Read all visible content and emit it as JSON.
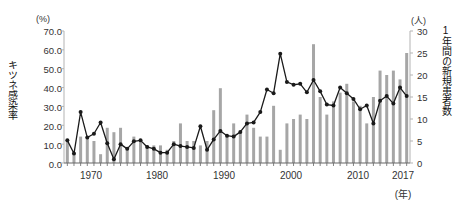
{
  "chart_data": {
    "type": "bar",
    "title": "",
    "subtitle": "",
    "xlabel": "(年)",
    "ylabel_left": "キツネ感染率",
    "ylabel_right": "1年間の新規患者数",
    "yunit_left": "(%)",
    "yunit_right": "(人)",
    "ylim_left": [
      0,
      70
    ],
    "ylim_right": [
      0,
      30
    ],
    "yticks_left": [
      "0.0",
      "10.0",
      "20.0",
      "30.0",
      "40.0",
      "50.0",
      "60.0",
      "70.0"
    ],
    "yticks_right": [
      "0",
      "5",
      "10",
      "15",
      "20",
      "25",
      "30"
    ],
    "xlim": [
      1966,
      2017
    ],
    "xticks": [
      1970,
      1980,
      1990,
      2000,
      2010,
      2017
    ],
    "xtick_labels": [
      "1970",
      "1980",
      "1990",
      "2000",
      "2010",
      "2017"
    ],
    "grid": false,
    "legend": "none",
    "bar_color": "#a6a6a6",
    "line_color": "#1a1a1a",
    "marker_color": "#1a1a1a",
    "axis_color": "#b3b3b3",
    "x": [
      1966,
      1967,
      1968,
      1969,
      1970,
      1971,
      1972,
      1973,
      1974,
      1975,
      1976,
      1977,
      1978,
      1979,
      1980,
      1981,
      1982,
      1983,
      1984,
      1985,
      1986,
      1987,
      1988,
      1989,
      1990,
      1991,
      1992,
      1993,
      1994,
      1995,
      1996,
      1997,
      1998,
      1999,
      2000,
      2001,
      2002,
      2003,
      2004,
      2005,
      2006,
      2007,
      2008,
      2009,
      2010,
      2011,
      2012,
      2013,
      2014,
      2015,
      2016,
      2017
    ],
    "series": [
      {
        "name": "1年間の新規患者数",
        "type": "bar",
        "axis": "right",
        "unit": "人",
        "values": [
          5,
          2,
          6,
          6,
          5,
          2,
          8,
          7,
          8,
          3,
          6,
          5,
          4,
          4,
          4,
          3,
          5,
          9,
          5,
          5,
          4,
          5,
          12,
          17,
          6,
          9,
          7,
          11,
          8,
          6,
          6,
          13,
          3,
          9,
          10,
          11,
          10,
          27,
          15,
          11,
          14,
          16,
          18,
          14,
          13,
          9,
          15,
          21,
          20,
          21,
          19,
          25
        ]
      },
      {
        "name": "キツネ感染率",
        "type": "line",
        "axis": "left",
        "unit": "%",
        "values": [
          12.0,
          5.0,
          27.0,
          13.5,
          15.5,
          21.5,
          10.5,
          2.0,
          10.0,
          7.5,
          11.5,
          12.0,
          8.5,
          7.5,
          5.5,
          5.5,
          10.0,
          9.0,
          8.5,
          8.0,
          19.5,
          7.0,
          12.5,
          17.0,
          14.5,
          14.0,
          16.5,
          21.0,
          21.5,
          27.0,
          39.0,
          37.0,
          58.0,
          43.0,
          41.5,
          42.0,
          37.5,
          44.0,
          38.0,
          31.0,
          30.5,
          40.0,
          37.0,
          34.0,
          28.5,
          30.5,
          21.0,
          33.0,
          35.5,
          31.5,
          40.0,
          35.5
        ]
      }
    ]
  }
}
